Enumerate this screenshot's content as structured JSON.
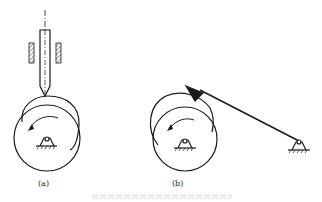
{
  "figure": {
    "subfigures": [
      {
        "id": "a",
        "label": "(a)",
        "description": "Translating knife-edge follower with guide bearings on a rotating cam (disc) with pivot support"
      },
      {
        "id": "b",
        "label": "(b)",
        "description": "Oscillating knife-edge follower arm pivoted at ground support, contacting rotating cam"
      }
    ],
    "caption": "",
    "colors": {
      "line": "#1a1a1a",
      "background": "#ffffff"
    }
  }
}
